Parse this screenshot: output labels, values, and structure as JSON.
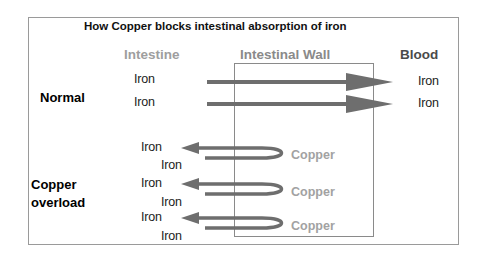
{
  "title": "How Copper blocks intestinal absorption of iron",
  "columns": {
    "intestine": "Intestine",
    "wall": "Intestinal Wall",
    "blood": "Blood"
  },
  "rows": {
    "normal": {
      "label": "Normal",
      "left_iron": [
        "Iron",
        "Iron"
      ],
      "right_iron": [
        "Iron",
        "Iron"
      ]
    },
    "overload": {
      "label_line1": "Copper",
      "label_line2": "overload",
      "left_iron_top": [
        "Iron",
        "Iron",
        "Iron"
      ],
      "left_iron_bottom": [
        "Iron",
        "Iron",
        "Iron"
      ],
      "copper": [
        "Copper",
        "Copper",
        "Copper"
      ]
    }
  },
  "colors": {
    "arrow": "#6e6e6e",
    "copper_text": "#a2a2a2",
    "intestine_text": "#9e9e9e",
    "wall_text": "#8a8a8a",
    "blood_text": "#4a4a4a"
  }
}
